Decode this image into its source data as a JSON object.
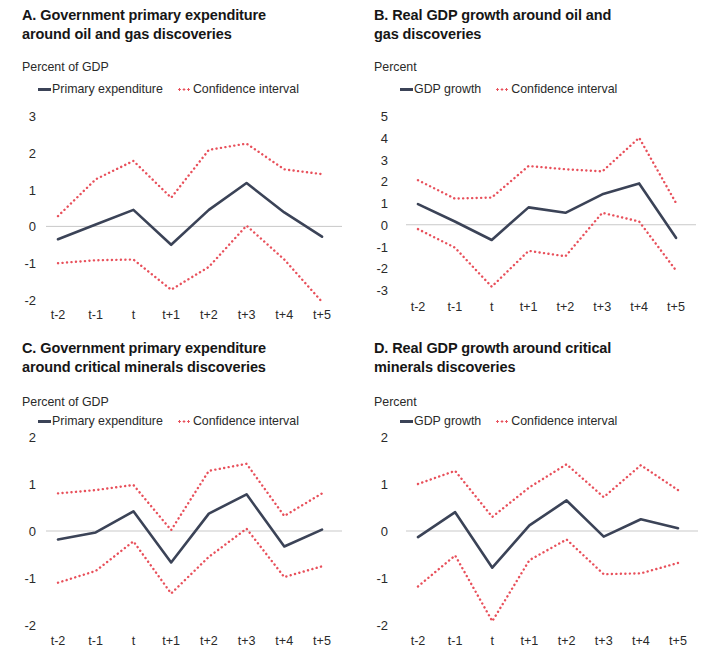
{
  "figure": {
    "colors": {
      "line": "#3b4357",
      "ci": "#e8505b",
      "zero_line": "#c9c9c9",
      "text": "#2a2a2a"
    },
    "legend_labels": {
      "primary_expenditure": "Primary expenditure",
      "gdp_growth": "GDP growth",
      "confidence_interval": "Confidence interval"
    },
    "categories": [
      "t-2",
      "t-1",
      "t",
      "t+1",
      "t+2",
      "t+3",
      "t+4",
      "t+5"
    ]
  },
  "chart_data": [
    {
      "type": "line",
      "panel": "A",
      "title": "A. Government primary expenditure around oil and gas discoveries",
      "ylabel": "Percent of GDP",
      "xlabel": "",
      "ylim": [
        -2,
        3
      ],
      "yticks": [
        3,
        2,
        1,
        0,
        -1,
        -2
      ],
      "ytick_labels": [
        "3",
        "2",
        "1",
        "0",
        "-1",
        "-2"
      ],
      "x": [
        "t-2",
        "t-1",
        "t",
        "t+1",
        "t+2",
        "t+3",
        "t+4",
        "t+5"
      ],
      "grid": false,
      "legend_position": "top",
      "series": [
        {
          "name": "Primary expenditure",
          "style": "solid",
          "color": "#3b4357",
          "values": [
            -0.35,
            0.05,
            0.45,
            -0.5,
            0.45,
            1.18,
            0.38,
            -0.28
          ]
        },
        {
          "name": "Confidence interval upper",
          "style": "dotted",
          "color": "#e8505b",
          "values": [
            0.28,
            1.28,
            1.78,
            0.78,
            2.08,
            2.25,
            1.55,
            1.42
          ]
        },
        {
          "name": "Confidence interval lower",
          "style": "dotted",
          "color": "#e8505b",
          "values": [
            -1.0,
            -0.92,
            -0.9,
            -1.72,
            -1.1,
            0.02,
            -0.9,
            -2.05
          ]
        }
      ]
    },
    {
      "type": "line",
      "panel": "B",
      "title": "B. Real GDP growth around oil and gas discoveries",
      "ylabel": "Percent",
      "xlabel": "",
      "ylim": [
        -3,
        5
      ],
      "yticks": [
        5,
        4,
        3,
        2,
        1,
        0,
        -1,
        -2,
        -3
      ],
      "ytick_labels": [
        "5",
        "4",
        "3",
        "2",
        "1",
        "0",
        "-1",
        "-2",
        "-3"
      ],
      "x": [
        "t-2",
        "t-1",
        "t",
        "t+1",
        "t+2",
        "t+3",
        "t+4",
        "t+5"
      ],
      "grid": false,
      "legend_position": "top",
      "series": [
        {
          "name": "GDP growth",
          "style": "solid",
          "color": "#3b4357",
          "values": [
            0.95,
            0.15,
            -0.7,
            0.8,
            0.55,
            1.4,
            1.9,
            -0.6
          ]
        },
        {
          "name": "Confidence interval upper",
          "style": "dotted",
          "color": "#e8505b",
          "values": [
            2.05,
            1.2,
            1.25,
            2.7,
            2.55,
            2.45,
            4.0,
            1.0
          ]
        },
        {
          "name": "Confidence interval lower",
          "style": "dotted",
          "color": "#e8505b",
          "values": [
            -0.2,
            -1.05,
            -2.85,
            -1.2,
            -1.45,
            0.55,
            0.15,
            -2.1
          ]
        }
      ]
    },
    {
      "type": "line",
      "panel": "C",
      "title": "C. Government primary expenditure around critical minerals discoveries",
      "ylabel": "Percent of GDP",
      "xlabel": "",
      "ylim": [
        -2,
        2
      ],
      "yticks": [
        2,
        1,
        0,
        -1,
        -2
      ],
      "ytick_labels": [
        "2",
        "1",
        "0",
        "-1",
        "-2"
      ],
      "x": [
        "t-2",
        "t-1",
        "t",
        "t+1",
        "t+2",
        "t+3",
        "t+4",
        "t+5"
      ],
      "grid": false,
      "legend_position": "top",
      "series": [
        {
          "name": "Primary expenditure",
          "style": "solid",
          "color": "#3b4357",
          "values": [
            -0.18,
            -0.03,
            0.42,
            -0.67,
            0.37,
            0.78,
            -0.33,
            0.03
          ]
        },
        {
          "name": "Confidence interval upper",
          "style": "dotted",
          "color": "#e8505b",
          "values": [
            0.8,
            0.87,
            0.98,
            0.02,
            1.28,
            1.43,
            0.32,
            0.8
          ]
        },
        {
          "name": "Confidence interval lower",
          "style": "dotted",
          "color": "#e8505b",
          "values": [
            -1.1,
            -0.85,
            -0.22,
            -1.33,
            -0.55,
            0.05,
            -0.98,
            -0.75
          ]
        }
      ]
    },
    {
      "type": "line",
      "panel": "D",
      "title": "D. Real GDP growth around critical minerals discoveries",
      "ylabel": "Percent",
      "xlabel": "",
      "ylim": [
        -2,
        2
      ],
      "yticks": [
        2,
        1,
        0,
        -1,
        -2
      ],
      "ytick_labels": [
        "2",
        "1",
        "0",
        "-1",
        "-2"
      ],
      "x": [
        "t-2",
        "t-1",
        "t",
        "t+1",
        "t+2",
        "t+3",
        "t+4",
        "t+5"
      ],
      "grid": false,
      "legend_position": "top",
      "series": [
        {
          "name": "GDP growth",
          "style": "solid",
          "color": "#3b4357",
          "values": [
            -0.13,
            0.4,
            -0.78,
            0.12,
            0.65,
            -0.12,
            0.25,
            0.06
          ]
        },
        {
          "name": "Confidence interval upper",
          "style": "dotted",
          "color": "#e8505b",
          "values": [
            1.0,
            1.28,
            0.3,
            0.93,
            1.42,
            0.72,
            1.4,
            0.87
          ]
        },
        {
          "name": "Confidence interval lower",
          "style": "dotted",
          "color": "#e8505b",
          "values": [
            -1.18,
            -0.52,
            -1.92,
            -0.62,
            -0.18,
            -0.92,
            -0.9,
            -0.68
          ]
        }
      ]
    }
  ],
  "panels": {
    "A": {
      "title_line1": "A. Government primary expenditure",
      "title_line2": "around oil and gas discoveries",
      "unit": "Percent of GDP",
      "legend_series": "Primary expenditure",
      "legend_ci": "Confidence interval"
    },
    "B": {
      "title_line1": "B. Real GDP growth around oil and",
      "title_line2": "gas discoveries",
      "unit": "Percent",
      "legend_series": "GDP growth",
      "legend_ci": "Confidence interval"
    },
    "C": {
      "title_line1": "C. Government primary expenditure",
      "title_line2": "around critical minerals discoveries",
      "unit": "Percent of GDP",
      "legend_series": "Primary expenditure",
      "legend_ci": "Confidence interval"
    },
    "D": {
      "title_line1": "D. Real GDP growth around critical",
      "title_line2": "minerals discoveries",
      "unit": "Percent",
      "legend_series": "GDP growth",
      "legend_ci": "Confidence interval"
    }
  }
}
